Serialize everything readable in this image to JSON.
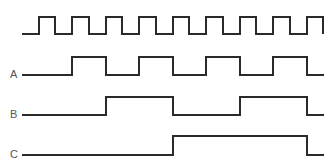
{
  "diagram": {
    "type": "timing-diagram",
    "stroke_color": "#2a2a2a",
    "label_color": "#555555",
    "signals": [
      {
        "name": "clock",
        "label": "",
        "y_high": 17,
        "y_low": 34,
        "points": "22,34 39,34 39,17 55,17 55,34 72,34 72,17 89,17 89,34 106,34 106,17 122,17 122,34 139,34 139,17 156,17 156,34 173,34 173,17 189,17 189,34 206,34 206,17 223,17 223,34 240,34 240,17 256,17 256,34 273,34 273,17 290,17 290,34 307,34 307,17 323,17 323,34"
      },
      {
        "name": "A",
        "label": "A",
        "label_y": 69,
        "y_high": 57,
        "y_low": 75,
        "points": "22,75 72,75 72,57 106,57 106,75 139,75 139,57 173,57 173,75 206,75 206,57 240,57 240,75 273,75 273,57 307,57 307,75 324,75"
      },
      {
        "name": "B",
        "label": "B",
        "label_y": 109,
        "y_high": 97,
        "y_low": 115,
        "points": "22,115 106,115 106,97 173,97 173,115 240,115 240,97 307,97 307,115 324,115"
      },
      {
        "name": "C",
        "label": "C",
        "label_y": 149,
        "y_high": 136,
        "y_low": 155,
        "points": "22,155 173,155 173,136 307,136 307,155 324,155"
      }
    ]
  }
}
